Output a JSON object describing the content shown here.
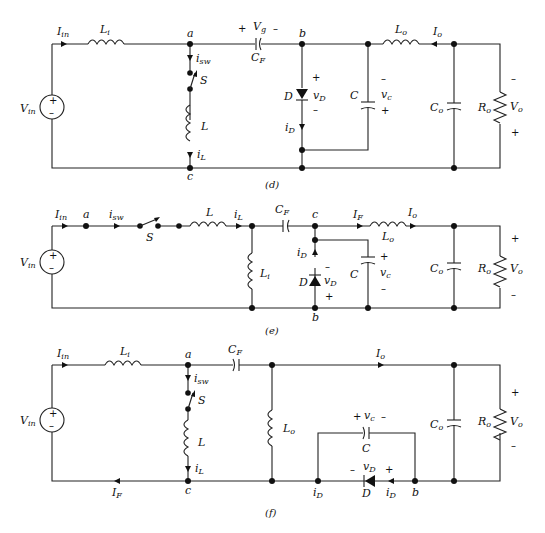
{
  "figures": [
    {
      "caption": "(d)",
      "labels": {
        "Iin": "I",
        "Iin_sub": "in",
        "Li": "L",
        "Li_sub": "i",
        "a": "a",
        "isw": "i",
        "isw_sub": "sw",
        "S": "S",
        "L": "L",
        "iL": "i",
        "iL_sub": "L",
        "c": "c",
        "Vin": "V",
        "Vin_sub": "in",
        "Vg": "V",
        "Vg_sub": "g",
        "Vg_plus": "+",
        "Vg_minus": "–",
        "CF": "C",
        "CF_sub": "F",
        "b": "b",
        "D": "D",
        "vD": "v",
        "vD_sub": "D",
        "vD_plus": "+",
        "vD_minus": "–",
        "iD": "i",
        "iD_sub": "D",
        "C": "C",
        "vc": "v",
        "vc_sub": "c",
        "vc_minus": "–",
        "vc_plus": "+",
        "Lo": "L",
        "Lo_sub": "o",
        "Io": "I",
        "Io_sub": "o",
        "Co": "C",
        "Co_sub": "o",
        "Ro": "R",
        "Ro_sub": "o",
        "Vo": "V",
        "Vo_sub": "o",
        "Vo_top": "–",
        "Vo_bottom": "+"
      }
    },
    {
      "caption": "(e)",
      "labels": {
        "Iin": "I",
        "Iin_sub": "in",
        "a": "a",
        "isw": "i",
        "isw_sub": "sw",
        "S": "S",
        "L": "L",
        "iL": "i",
        "iL_sub": "L",
        "Li": "L",
        "Li_sub": "i",
        "Vin": "V",
        "Vin_sub": "in",
        "CF": "C",
        "CF_sub": "F",
        "c": "c",
        "b": "b",
        "iD": "i",
        "iD_sub": "D",
        "D": "D",
        "vD": "v",
        "vD_sub": "D",
        "vD_minus": "–",
        "vD_plus": "+",
        "C": "C",
        "vc": "v",
        "vc_sub": "c",
        "vc_plus": "+",
        "vc_minus": "–",
        "IF": "I",
        "IF_sub": "F",
        "Lo": "L",
        "Lo_sub": "o",
        "Io": "I",
        "Io_sub": "o",
        "Co": "C",
        "Co_sub": "o",
        "Ro": "R",
        "Ro_sub": "o",
        "Vo": "V",
        "Vo_sub": "o",
        "Vo_top": "+",
        "Vo_bottom": "–"
      }
    },
    {
      "caption": "(f)",
      "labels": {
        "Iin": "I",
        "Iin_sub": "in",
        "Li": "L",
        "Li_sub": "i",
        "a": "a",
        "isw": "i",
        "isw_sub": "sw",
        "S": "S",
        "L": "L",
        "iL": "i",
        "iL_sub": "L",
        "c": "c",
        "IF": "I",
        "IF_sub": "F",
        "Vin": "V",
        "Vin_sub": "in",
        "CF": "C",
        "CF_sub": "F",
        "Lo": "L",
        "Lo_sub": "o",
        "Io": "I",
        "Io_sub": "o",
        "vc": "v",
        "vc_sub": "c",
        "vc_plus": "+",
        "vc_minus": "–",
        "C": "C",
        "vD": "v",
        "vD_sub": "D",
        "vD_minus": "–",
        "vD_plus": "+",
        "iD1": "i",
        "iD1_sub": "D",
        "D": "D",
        "iD2": "i",
        "iD2_sub": "D",
        "b": "b",
        "Co": "C",
        "Co_sub": "o",
        "Ro": "R",
        "Ro_sub": "o",
        "Vo": "V",
        "Vo_sub": "o",
        "Vo_top": "+",
        "Vo_bottom": "–"
      }
    }
  ],
  "source_symbols": {
    "plus": "+",
    "minus": "–"
  }
}
